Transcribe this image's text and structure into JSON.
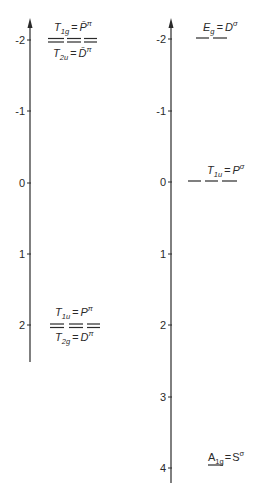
{
  "diagram": {
    "type": "energy-level-diagram",
    "colors": {
      "ink": "#2a2a2a",
      "background": "#ffffff"
    },
    "left_panel": {
      "axis": {
        "ticks": [
          "-2",
          "-1",
          "0",
          "1",
          "2"
        ]
      },
      "levels": [
        {
          "value": -2,
          "upper_label": {
            "sym": "T",
            "sub": "1g",
            "eq": "=",
            "rhs": "P̄",
            "sup": "π"
          },
          "lower_label": {
            "sym": "T",
            "sub": "2u",
            "eq": "=",
            "rhs": "D̄",
            "sup": "π"
          },
          "lines": "double-dashed"
        },
        {
          "value": 2,
          "upper_label": {
            "sym": "T",
            "sub": "1u",
            "eq": "=",
            "rhs": "P",
            "sup": "π"
          },
          "lower_label": {
            "sym": "T",
            "sub": "2g",
            "eq": "=",
            "rhs": "D",
            "sup": "π"
          },
          "lines": "double-dashed"
        }
      ]
    },
    "right_panel": {
      "axis": {
        "ticks": [
          "-2",
          "-1",
          "0",
          "1",
          "2",
          "3",
          "4"
        ]
      },
      "levels": [
        {
          "value": -2,
          "label": {
            "sym": "E",
            "sub": "g",
            "eq": "=",
            "rhs": "D",
            "sup": "σ"
          },
          "lines": "2-segment"
        },
        {
          "value": 0,
          "label": {
            "sym": "T",
            "sub": "1u",
            "eq": "=",
            "rhs": "P",
            "sup": "σ"
          },
          "lines": "3-segment"
        },
        {
          "value": 4,
          "label": {
            "sym": "A",
            "sub": "1g",
            "eq": "=",
            "rhs": "S",
            "sup": "σ"
          },
          "lines": "1-segment"
        }
      ]
    }
  }
}
